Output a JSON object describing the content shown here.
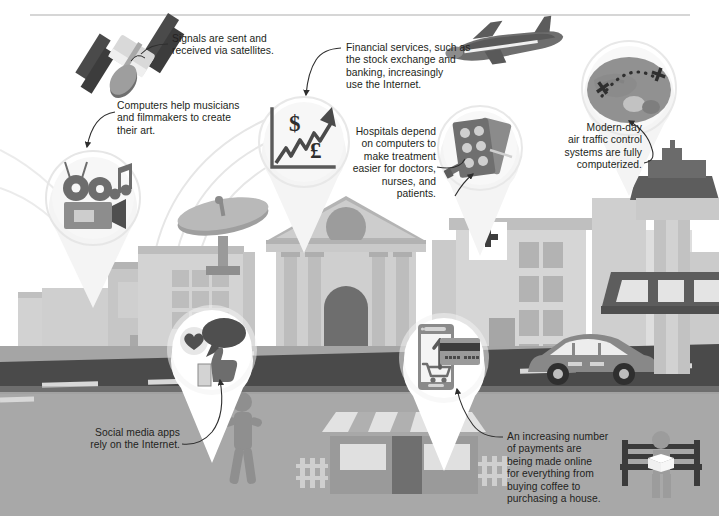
{
  "illustration": {
    "title": "How computers are used in everyday life",
    "palette": {
      "page_background": "#ffffff",
      "top_rule": "#c9c9c9",
      "text": "#231f20",
      "road": "#4a4a4a",
      "pavement": "#9d9d9d",
      "ground": "#a8a8a8",
      "building_light": "#d8d8d8",
      "building_mid": "#bfbfbf",
      "building_dark": "#8d8d8d",
      "icon_dark": "#4f4f4f",
      "icon_mid": "#7d7d7d",
      "pin_fill": "#f2f2f2",
      "pin_ring": "#e3e3e3",
      "accent_dark": "#3a3a3a",
      "white": "#ffffff"
    },
    "top_rule": {
      "visible": true,
      "x1": 30,
      "x2": 690,
      "y": 15
    }
  },
  "callouts": [
    {
      "id": "satellites",
      "name": "satellite-callout",
      "text": "Signals are sent and\nreceived via satellites.",
      "align": "left",
      "x": 172,
      "y": 33,
      "width": 160
    },
    {
      "id": "music-film",
      "name": "music-film-callout",
      "text": "Computers help musicians\nand filmmakers to create\ntheir art.",
      "align": "left",
      "x": 117,
      "y": 100,
      "width": 180
    },
    {
      "id": "financial",
      "name": "financial-services-callout",
      "text": "Financial services, such as\nthe stock exchange and\nbanking, increasingly\nuse the Internet.",
      "align": "left",
      "x": 346,
      "y": 42,
      "width": 160
    },
    {
      "id": "hospitals",
      "name": "hospitals-callout",
      "text": "Hospitals depend\non computers to\nmake treatment\neasier for doctors,\nnurses, and\npatients.",
      "align": "right",
      "x": 330,
      "y": 126,
      "width": 105
    },
    {
      "id": "air-traffic",
      "name": "air-traffic-control-callout",
      "text": "Modern-day\nair traffic control\nsystems are fully\ncomputerized.",
      "align": "right",
      "x": 540,
      "y": 122,
      "width": 100
    },
    {
      "id": "social-media",
      "name": "social-media-callout",
      "text": "Social media apps\nrely on the Internet.",
      "align": "right",
      "x": 68,
      "y": 427,
      "width": 110
    },
    {
      "id": "payments",
      "name": "online-payments-callout",
      "text": "An increasing number\nof payments are\nbeing made online\nfor everything from\nbuying coffee to\npurchasing a house.",
      "align": "left",
      "x": 507,
      "y": 431,
      "width": 130
    }
  ],
  "pins": [
    {
      "id": "music-film",
      "name": "pin-music-film",
      "label": "movie camera and music note",
      "cx": 92,
      "cy": 198,
      "r": 50
    },
    {
      "id": "stock-chart",
      "name": "pin-stock-chart",
      "label": "rising stock graph with dollar and pound symbols",
      "cx": 303,
      "cy": 142,
      "r": 50
    },
    {
      "id": "medicine",
      "name": "pin-medicine",
      "label": "pill blister packs and syringe",
      "cx": 479,
      "cy": 147,
      "r": 47
    },
    {
      "id": "globe",
      "name": "pin-globe-flightpath",
      "label": "globe with dotted flight path between two planes",
      "cx": 628,
      "cy": 88,
      "r": 52
    },
    {
      "id": "social",
      "name": "pin-social-media",
      "label": "heart, speech bubble and thumbs up",
      "cx": 211,
      "cy": 350,
      "r": 49
    },
    {
      "id": "payment",
      "name": "pin-mobile-payment",
      "label": "smartphone with shopping cart and credit card",
      "cx": 443,
      "cy": 358,
      "r": 48
    }
  ],
  "scene_objects": [
    {
      "name": "satellite",
      "label": "Communications satellite"
    },
    {
      "name": "airplane",
      "label": "Passenger airplane"
    },
    {
      "name": "satellite-dish",
      "label": "Large satellite dish"
    },
    {
      "name": "bank-building",
      "label": "Bank with columns and pediment"
    },
    {
      "name": "hospital-building",
      "label": "Hospital with red cross sign"
    },
    {
      "name": "control-tower",
      "label": "Air traffic control tower"
    },
    {
      "name": "shop-front",
      "label": "Shop with striped awning"
    },
    {
      "name": "car",
      "label": "Car on the road"
    },
    {
      "name": "pedestrian",
      "label": "Walking person"
    },
    {
      "name": "bench-reader",
      "label": "Person reading on a bench"
    },
    {
      "name": "road",
      "label": "Road with lane markings"
    }
  ],
  "icon_symbols": {
    "dollar": "$",
    "pound": "£",
    "card_digits": "▪▪▪▪  ▪▪▪▪"
  }
}
